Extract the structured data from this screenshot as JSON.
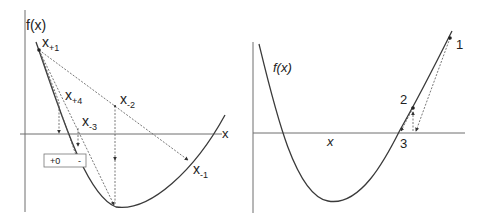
{
  "left_panel": {
    "y_axis_label": "f(x)",
    "x_axis_label": "x",
    "points": [
      {
        "base": "x",
        "sub": "+1"
      },
      {
        "base": "x",
        "sub": "+4"
      },
      {
        "base": "x",
        "sub": "-2"
      },
      {
        "base": "x",
        "sub": "-3"
      },
      {
        "base": "x",
        "sub": "-1"
      }
    ],
    "sign_box": {
      "plus": "+0",
      "minus": "-"
    }
  },
  "right_panel": {
    "y_axis_label": "f(x)",
    "x_axis_label": "x",
    "points": [
      "1",
      "2",
      "3"
    ]
  }
}
